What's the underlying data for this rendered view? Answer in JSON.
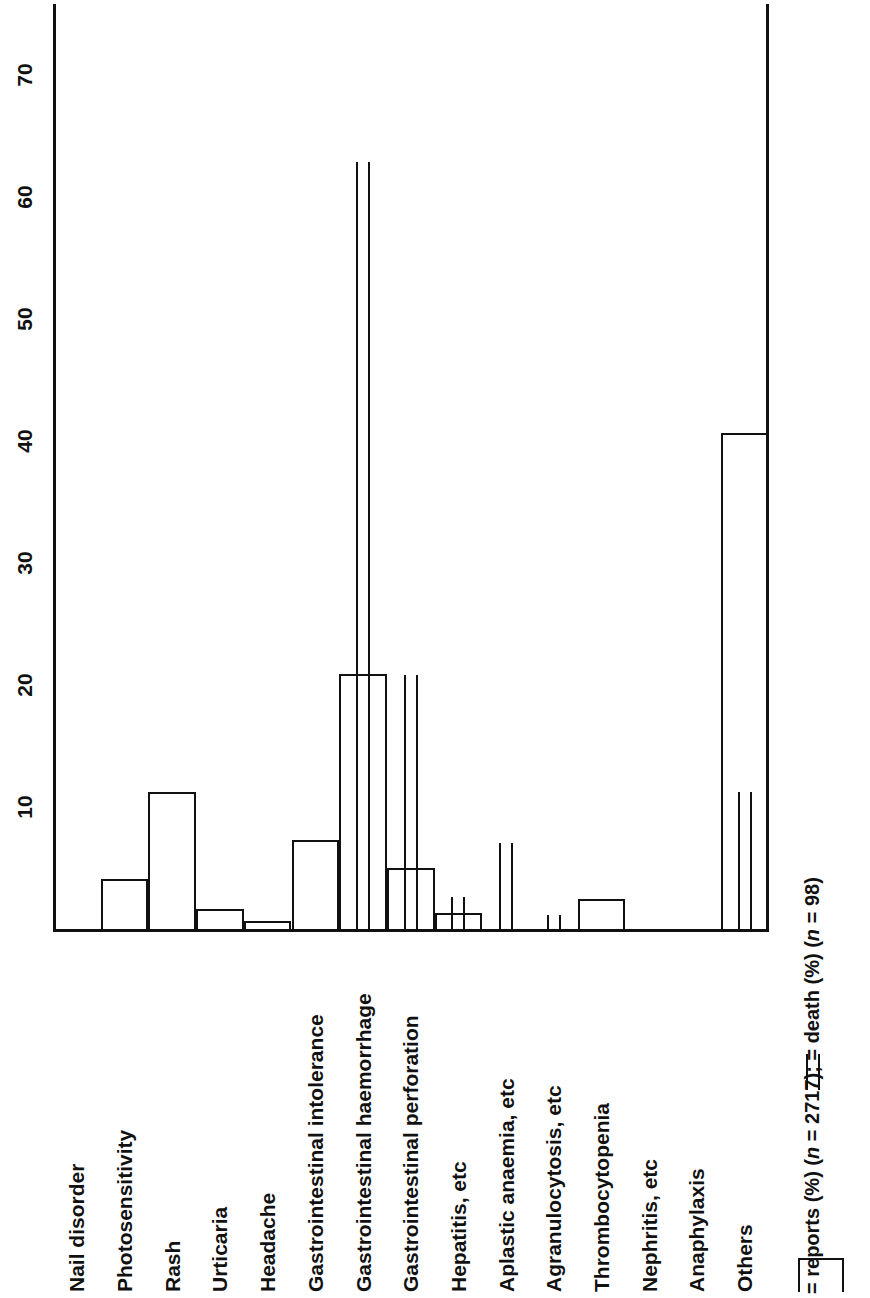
{
  "chart_data": {
    "type": "bar",
    "title": "",
    "orientation": "rotated-90",
    "xlabel": "",
    "ylabel": "",
    "ylim": [
      0,
      75
    ],
    "grid": false,
    "legend_position": "bottom-right",
    "axis_ticks": [
      10,
      20,
      30,
      40,
      50,
      60,
      70
    ],
    "categories": [
      "Nail disorder",
      "Photosensitivity",
      "Rash",
      "Urticaria",
      "Headache",
      "Gastrointestinal intolerance",
      "Gastrointestinal haemorrhage",
      "Gastrointestinal perforation",
      "Hepatitis, etc",
      "Aplastic anaemia, etc",
      "Agranulocytosis, etc",
      "Thrombocytopenia",
      "Nephritis, etc",
      "Anaphylaxis",
      "Others"
    ],
    "series": [
      {
        "name": "reports (%)",
        "n": 2717,
        "marker": "open-bar",
        "values": [
          0.2,
          4.3,
          11.4,
          1.8,
          0.8,
          7.5,
          21.1,
          5.2,
          1.5,
          0.2,
          0.0,
          2.6,
          0.0,
          0.0,
          40.8
        ]
      },
      {
        "name": "death (%)",
        "n": 98,
        "marker": "double-rule",
        "values": [
          0,
          0,
          0,
          0,
          0,
          0,
          63.0,
          21.0,
          2.8,
          7.2,
          1.3,
          0,
          0,
          0,
          11.4
        ]
      }
    ],
    "legend": [
      {
        "swatch": "open-bar",
        "label": "= reports (%) (n = 2717);"
      },
      {
        "swatch": "double-rule",
        "label": "= death (%) (n = 98)"
      }
    ],
    "legend_full_text": "= reports (%) (n = 2717); = death (%) (n = 98)"
  },
  "legend": {
    "reports_prefix": "= reports (%) (",
    "reports_italic_n": "n",
    "reports_suffix": " = 2717); ",
    "death_prefix": "= death (%) (",
    "death_italic_n": "n",
    "death_suffix": " = 98)"
  }
}
